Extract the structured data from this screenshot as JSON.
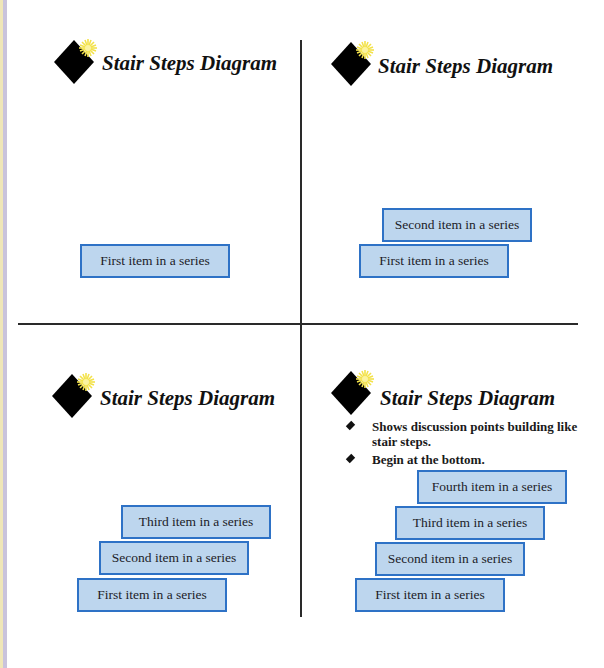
{
  "title": "Stair Steps Diagram",
  "colors": {
    "box_fill": "#bdd6ee",
    "box_border": "#2e72c6",
    "divider": "#2a2a2a",
    "logo_diamond": "#000000",
    "logo_star": "#f3e24a"
  },
  "panels": [
    {
      "title": "Stair Steps Diagram",
      "items": [
        "First item in a series"
      ]
    },
    {
      "title": "Stair Steps Diagram",
      "items": [
        "First item in a series",
        "Second item in a series"
      ]
    },
    {
      "title": "Stair Steps Diagram",
      "items": [
        "First item in a series",
        "Second item in a series",
        "Third item in a series"
      ]
    },
    {
      "title": "Stair Steps Diagram",
      "bullets": [
        "Shows discussion points building like stair steps.",
        "Begin at the bottom."
      ],
      "items": [
        "First item in a series",
        "Second item in a series",
        "Third item in a series",
        "Fourth item in a series"
      ]
    }
  ]
}
